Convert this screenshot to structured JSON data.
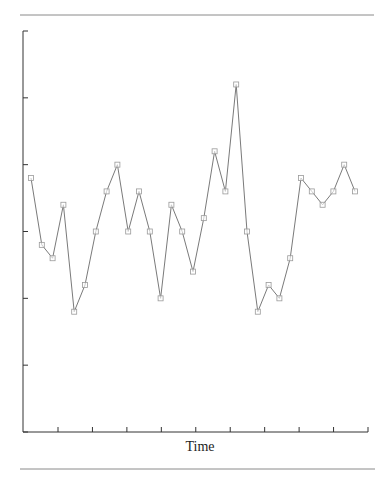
{
  "chart_data": {
    "type": "line",
    "title": "",
    "xlabel": "Time",
    "ylabel": "",
    "x": [
      1,
      2,
      3,
      4,
      5,
      6,
      7,
      8,
      9,
      10,
      11,
      12,
      13,
      14,
      15,
      16,
      17,
      18,
      19,
      20,
      21,
      22,
      23,
      24,
      25,
      26,
      27,
      28,
      29,
      30,
      31
    ],
    "series": [
      {
        "name": "series",
        "marker": "square",
        "values": [
          3.8,
          2.8,
          2.6,
          3.4,
          1.8,
          2.2,
          3.0,
          3.6,
          4.0,
          3.0,
          3.6,
          3.0,
          2.0,
          3.4,
          3.0,
          2.4,
          3.2,
          4.2,
          3.6,
          5.2,
          3.0,
          1.8,
          2.2,
          2.0,
          2.6,
          3.8,
          3.6,
          3.4,
          3.6,
          4.0,
          3.6
        ]
      }
    ],
    "ylim": [
      0,
      6
    ],
    "y_ticks_count": 7,
    "x_ticks_count": 10,
    "y_tick_labels": [],
    "x_tick_labels": [],
    "grid": false,
    "legend": false,
    "colors": {
      "line": "#7a7a7a",
      "marker": "#9a9a9a",
      "axis": "#333333",
      "separator": "#888888"
    }
  }
}
